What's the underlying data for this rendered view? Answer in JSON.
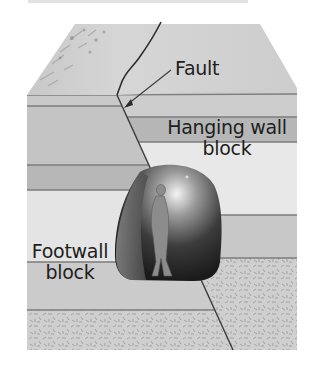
{
  "figure": {
    "type": "block diagram"
  },
  "labels": {
    "fault": "Fault",
    "hanging_wall_line1": "Hanging wall",
    "hanging_wall_line2": "block",
    "footwall_line1": "Footwall",
    "footwall_line2": "block"
  },
  "colors": {
    "background": "#ffffff",
    "top_surface": "#d2d2d2",
    "layer_light": "#e6e6e6",
    "layer_mid": "#c9c9c9",
    "layer_dark": "#b4b4b4",
    "layer_lines": "#7d7d7d",
    "fault_line": "#3a3a3a",
    "text": "#1e1e1e"
  }
}
